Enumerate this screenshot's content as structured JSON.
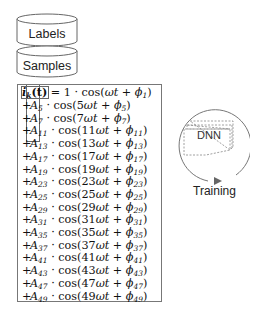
{
  "stores": [
    {
      "label": "Labels"
    },
    {
      "label": "Samples"
    }
  ],
  "equation": {
    "lhs": "i",
    "lhs_sub": "k",
    "lhs_arg": "(t)",
    "first_line": {
      "coef": "1",
      "harmonic": "",
      "phase_sub": "1"
    },
    "terms": [
      {
        "amp_sub": "5",
        "harmonic": "5",
        "phase_sub": "5"
      },
      {
        "amp_sub": "7",
        "harmonic": "7",
        "phase_sub": "7"
      },
      {
        "amp_sub": "11",
        "harmonic": "11",
        "phase_sub": "11"
      },
      {
        "amp_sub": "13",
        "harmonic": "13",
        "phase_sub": "13"
      },
      {
        "amp_sub": "17",
        "harmonic": "17",
        "phase_sub": "17"
      },
      {
        "amp_sub": "19",
        "harmonic": "19",
        "phase_sub": "19"
      },
      {
        "amp_sub": "23",
        "harmonic": "23",
        "phase_sub": "23"
      },
      {
        "amp_sub": "25",
        "harmonic": "25",
        "phase_sub": "25"
      },
      {
        "amp_sub": "29",
        "harmonic": "29",
        "phase_sub": "29"
      },
      {
        "amp_sub": "31",
        "harmonic": "31",
        "phase_sub": "31"
      },
      {
        "amp_sub": "35",
        "harmonic": "35",
        "phase_sub": "35"
      },
      {
        "amp_sub": "37",
        "harmonic": "37",
        "phase_sub": "37"
      },
      {
        "amp_sub": "41",
        "harmonic": "41",
        "phase_sub": "41"
      },
      {
        "amp_sub": "43",
        "harmonic": "43",
        "phase_sub": "43"
      },
      {
        "amp_sub": "47",
        "harmonic": "47",
        "phase_sub": "47"
      },
      {
        "amp_sub": "49",
        "harmonic": "49",
        "phase_sub": "49"
      }
    ]
  },
  "model": {
    "label": "DNN"
  },
  "loop": {
    "label": "Training"
  }
}
